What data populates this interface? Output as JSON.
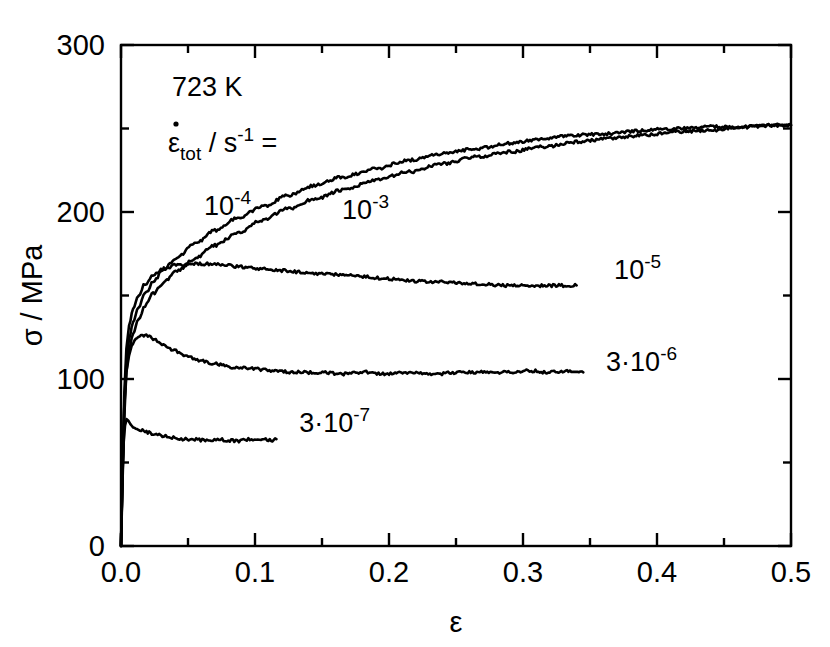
{
  "chart_data": {
    "type": "line",
    "title": "",
    "xlabel": "ε",
    "ylabel": "σ / MPa",
    "xlim": [
      0.0,
      0.5
    ],
    "ylim": [
      0,
      300
    ],
    "grid": false,
    "legend_position": "inline-curve-labels",
    "x_major_ticks": [
      "0.0",
      "0.1",
      "0.2",
      "0.3",
      "0.4",
      "0.5"
    ],
    "x_major_tick_values": [
      0.0,
      0.1,
      0.2,
      0.3,
      0.4,
      0.5
    ],
    "x_minor_tick_values": [
      0.05,
      0.15,
      0.25,
      0.35,
      0.45
    ],
    "y_major_ticks": [
      "0",
      "100",
      "200",
      "300"
    ],
    "y_major_tick_values": [
      0,
      100,
      200,
      300
    ],
    "y_minor_tick_values": [
      50,
      150,
      250
    ],
    "annotations": {
      "temperature": "723 K",
      "rate_symbol_base": "ε",
      "rate_symbol_sub": "tot",
      "rate_symbol_rest": " / s",
      "rate_symbol_sup": "-1",
      "rate_symbol_eq": " ="
    },
    "series": [
      {
        "name": "1e-3",
        "label_base": "10",
        "label_sup": "-3",
        "label_prefix": "",
        "strain_rate": "10^-3 s^-1",
        "label_x": 0.165,
        "label_y": 196,
        "points": [
          [
            0.0,
            0
          ],
          [
            0.0012,
            40
          ],
          [
            0.0025,
            78
          ],
          [
            0.004,
            104
          ],
          [
            0.006,
            118
          ],
          [
            0.009,
            127
          ],
          [
            0.013,
            136
          ],
          [
            0.018,
            144
          ],
          [
            0.024,
            151
          ],
          [
            0.032,
            158
          ],
          [
            0.042,
            165
          ],
          [
            0.055,
            172
          ],
          [
            0.07,
            180
          ],
          [
            0.088,
            188
          ],
          [
            0.105,
            195
          ],
          [
            0.125,
            202
          ],
          [
            0.145,
            208
          ],
          [
            0.165,
            213
          ],
          [
            0.19,
            219
          ],
          [
            0.215,
            224
          ],
          [
            0.24,
            229
          ],
          [
            0.265,
            233
          ],
          [
            0.29,
            236
          ],
          [
            0.315,
            239
          ],
          [
            0.34,
            242
          ],
          [
            0.365,
            244
          ],
          [
            0.39,
            246
          ],
          [
            0.415,
            248
          ],
          [
            0.44,
            249
          ],
          [
            0.465,
            251
          ],
          [
            0.49,
            252
          ],
          [
            0.5,
            252
          ]
        ]
      },
      {
        "name": "1e-4",
        "label_base": "10",
        "label_sup": "-4",
        "label_prefix": "",
        "strain_rate": "10^-4 s^-1",
        "label_x": 0.062,
        "label_y": 198,
        "points": [
          [
            0.0,
            0
          ],
          [
            0.0012,
            45
          ],
          [
            0.0025,
            85
          ],
          [
            0.004,
            110
          ],
          [
            0.006,
            124
          ],
          [
            0.009,
            134
          ],
          [
            0.013,
            143
          ],
          [
            0.018,
            151
          ],
          [
            0.024,
            158
          ],
          [
            0.032,
            166
          ],
          [
            0.042,
            173
          ],
          [
            0.055,
            181
          ],
          [
            0.07,
            189
          ],
          [
            0.088,
            197
          ],
          [
            0.105,
            203
          ],
          [
            0.125,
            210
          ],
          [
            0.145,
            216
          ],
          [
            0.165,
            221
          ],
          [
            0.19,
            226
          ],
          [
            0.215,
            231
          ],
          [
            0.24,
            235
          ],
          [
            0.265,
            238
          ],
          [
            0.29,
            241
          ],
          [
            0.315,
            244
          ],
          [
            0.34,
            246
          ],
          [
            0.365,
            247
          ],
          [
            0.39,
            249
          ],
          [
            0.415,
            250
          ],
          [
            0.44,
            251
          ],
          [
            0.465,
            251
          ],
          [
            0.49,
            252
          ],
          [
            0.5,
            252
          ]
        ]
      },
      {
        "name": "1e-5",
        "label_base": "10",
        "label_sup": "-5",
        "label_prefix": "",
        "strain_rate": "10^-5 s^-1",
        "label_x": 0.368,
        "label_y": 160,
        "points": [
          [
            0.0,
            0
          ],
          [
            0.0012,
            50
          ],
          [
            0.0025,
            92
          ],
          [
            0.004,
            118
          ],
          [
            0.006,
            132
          ],
          [
            0.009,
            142
          ],
          [
            0.013,
            150
          ],
          [
            0.018,
            157
          ],
          [
            0.024,
            162
          ],
          [
            0.032,
            166
          ],
          [
            0.04,
            168
          ],
          [
            0.05,
            169
          ],
          [
            0.06,
            169
          ],
          [
            0.07,
            169
          ],
          [
            0.08,
            168
          ],
          [
            0.092,
            167
          ],
          [
            0.105,
            166
          ],
          [
            0.12,
            165
          ],
          [
            0.135,
            164
          ],
          [
            0.15,
            163
          ],
          [
            0.168,
            162
          ],
          [
            0.185,
            161
          ],
          [
            0.2,
            160
          ],
          [
            0.215,
            159
          ],
          [
            0.23,
            158
          ],
          [
            0.245,
            158
          ],
          [
            0.258,
            157
          ],
          [
            0.27,
            157
          ],
          [
            0.285,
            156
          ],
          [
            0.3,
            156
          ],
          [
            0.315,
            156
          ],
          [
            0.33,
            156
          ],
          [
            0.34,
            156
          ]
        ]
      },
      {
        "name": "3e-6",
        "label_base": "10",
        "label_sup": "-6",
        "label_prefix": "3·",
        "strain_rate": "3*10^-6 s^-1",
        "label_x": 0.362,
        "label_y": 105,
        "points": [
          [
            0.0,
            0
          ],
          [
            0.0012,
            48
          ],
          [
            0.0025,
            84
          ],
          [
            0.004,
            104
          ],
          [
            0.006,
            114
          ],
          [
            0.008,
            120
          ],
          [
            0.011,
            124
          ],
          [
            0.014,
            126
          ],
          [
            0.018,
            126
          ],
          [
            0.022,
            125
          ],
          [
            0.027,
            123
          ],
          [
            0.033,
            120
          ],
          [
            0.04,
            117
          ],
          [
            0.048,
            114
          ],
          [
            0.058,
            111
          ],
          [
            0.07,
            109
          ],
          [
            0.085,
            107
          ],
          [
            0.1,
            106
          ],
          [
            0.115,
            105
          ],
          [
            0.13,
            104
          ],
          [
            0.148,
            104
          ],
          [
            0.165,
            103
          ],
          [
            0.182,
            104
          ],
          [
            0.2,
            103
          ],
          [
            0.218,
            104
          ],
          [
            0.235,
            103
          ],
          [
            0.252,
            104
          ],
          [
            0.27,
            104
          ],
          [
            0.288,
            104
          ],
          [
            0.305,
            105
          ],
          [
            0.32,
            104
          ],
          [
            0.335,
            105
          ],
          [
            0.345,
            104
          ]
        ]
      },
      {
        "name": "3e-7",
        "label_base": "10",
        "label_sup": "-7",
        "label_prefix": "3·",
        "strain_rate": "3*10^-7 s^-1",
        "label_x": 0.133,
        "label_y": 68,
        "points": [
          [
            0.0,
            0
          ],
          [
            0.001,
            40
          ],
          [
            0.002,
            62
          ],
          [
            0.003,
            72
          ],
          [
            0.0042,
            76
          ],
          [
            0.0055,
            75
          ],
          [
            0.007,
            73
          ],
          [
            0.009,
            71
          ],
          [
            0.012,
            70
          ],
          [
            0.016,
            69
          ],
          [
            0.02,
            68
          ],
          [
            0.025,
            67
          ],
          [
            0.031,
            66
          ],
          [
            0.038,
            65
          ],
          [
            0.046,
            64
          ],
          [
            0.055,
            64
          ],
          [
            0.064,
            63
          ],
          [
            0.072,
            64
          ],
          [
            0.08,
            63
          ],
          [
            0.088,
            63
          ],
          [
            0.095,
            64
          ],
          [
            0.102,
            63
          ],
          [
            0.108,
            64
          ],
          [
            0.113,
            63
          ],
          [
            0.116,
            64
          ]
        ]
      }
    ]
  }
}
